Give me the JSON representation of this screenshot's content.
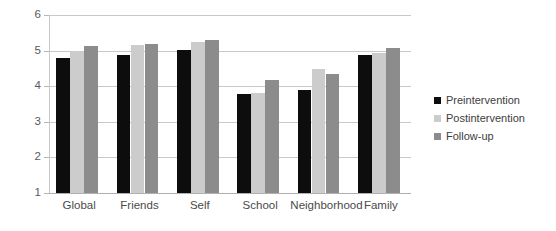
{
  "chart_data": {
    "type": "bar",
    "title": "",
    "xlabel": "",
    "ylabel": "",
    "ylim": [
      1,
      6
    ],
    "yticks": [
      1,
      2,
      3,
      4,
      5,
      6
    ],
    "grid": true,
    "legend_position": "right",
    "categories": [
      "Global",
      "Friends",
      "Self",
      "School",
      "Neighborhood",
      "Family"
    ],
    "series": [
      {
        "name": "Preintervention",
        "color": "#0d0d0d",
        "values": [
          4.78,
          4.88,
          5.02,
          3.77,
          3.89,
          4.87
        ]
      },
      {
        "name": "Postintervention",
        "color": "#cccccc",
        "values": [
          5.0,
          5.17,
          5.23,
          3.81,
          4.49,
          4.92
        ]
      },
      {
        "name": "Follow-up",
        "color": "#8c8c8c",
        "values": [
          5.12,
          5.18,
          5.3,
          4.17,
          4.33,
          5.06
        ]
      }
    ]
  },
  "legend": {
    "items": [
      {
        "label": "Preintervention",
        "color": "#0d0d0d"
      },
      {
        "label": "Postintervention",
        "color": "#cccccc"
      },
      {
        "label": "Follow-up",
        "color": "#8c8c8c"
      }
    ]
  },
  "axis": {
    "y_tick_labels": [
      "6",
      "5",
      "4",
      "3",
      "2",
      "1"
    ]
  }
}
